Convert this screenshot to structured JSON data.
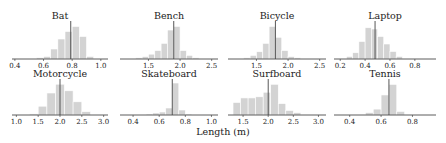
{
  "figure": {
    "xlabel": "Length (m)",
    "bar_color": "#d3d3d3",
    "bar_edge": "#ffffff",
    "mean_line_color": "#444444",
    "axis_color": "#333333"
  },
  "chart_data": [
    {
      "type": "bar",
      "title": "Bat",
      "xlim": [
        0.38,
        1.05
      ],
      "xticks": [
        0.4,
        0.6,
        0.8,
        1.0
      ],
      "tick_labels": [
        "0.4",
        "0.6",
        "0.8",
        "1.0"
      ],
      "bin_edges": [
        0.55,
        0.6,
        0.65,
        0.7,
        0.75,
        0.8,
        0.85,
        0.9,
        0.95,
        1.0
      ],
      "values": [
        1,
        2,
        8,
        16,
        22,
        26,
        18,
        2,
        0
      ],
      "mean": 0.79,
      "ylim": [
        0,
        28
      ]
    },
    {
      "type": "bar",
      "title": "Bench",
      "xlim": [
        1.05,
        2.6
      ],
      "xticks": [
        1.5,
        2.0,
        2.5
      ],
      "tick_labels": [
        "1.5",
        "2.0",
        "2.5"
      ],
      "bin_edges": [
        1.2,
        1.3,
        1.4,
        1.5,
        1.6,
        1.7,
        1.8,
        1.9,
        2.0,
        2.1,
        2.2,
        2.3,
        2.4
      ],
      "values": [
        0,
        1,
        2,
        4,
        7,
        13,
        24,
        27,
        7,
        3,
        1,
        0
      ],
      "mean": 1.9,
      "ylim": [
        0,
        29
      ]
    },
    {
      "type": "bar",
      "title": "Bicycle",
      "xlim": [
        1.05,
        2.6
      ],
      "xticks": [
        1.5,
        2.0,
        2.5
      ],
      "tick_labels": [
        "1.5",
        "2.0",
        "2.5"
      ],
      "bin_edges": [
        1.2,
        1.3,
        1.4,
        1.5,
        1.6,
        1.7,
        1.8,
        1.9,
        2.0,
        2.1,
        2.2,
        2.3,
        2.4,
        2.5
      ],
      "values": [
        0,
        1,
        3,
        6,
        13,
        27,
        18,
        7,
        2,
        1,
        0,
        0,
        0
      ],
      "mean": 1.8,
      "ylim": [
        0,
        29
      ]
    },
    {
      "type": "bar",
      "title": "Laptop",
      "xlim": [
        0.15,
        0.97
      ],
      "xticks": [
        0.2,
        0.4,
        0.6,
        0.8
      ],
      "tick_labels": [
        "0.2",
        "0.4",
        "0.6",
        "0.8"
      ],
      "bin_edges": [
        0.2,
        0.25,
        0.3,
        0.35,
        0.4,
        0.45,
        0.5,
        0.55,
        0.6,
        0.65,
        0.7,
        0.75,
        0.8,
        0.85
      ],
      "values": [
        0,
        2,
        5,
        14,
        25,
        24,
        18,
        12,
        6,
        2,
        0,
        0,
        0
      ],
      "mean": 0.48,
      "ylim": [
        0,
        28
      ]
    },
    {
      "type": "bar",
      "title": "Motorcycle",
      "xlim": [
        0.9,
        3.1
      ],
      "xticks": [
        1.0,
        1.5,
        2.0,
        2.5,
        3.0
      ],
      "tick_labels": [
        "1.0",
        "1.5",
        "2.0",
        "2.5",
        "3.0"
      ],
      "bin_edges": [
        1.3,
        1.5,
        1.7,
        1.9,
        2.1,
        2.3,
        2.5,
        2.7,
        2.9
      ],
      "values": [
        1,
        8,
        20,
        28,
        22,
        12,
        3,
        0
      ],
      "mean": 2.0,
      "ylim": [
        0,
        30
      ]
    },
    {
      "type": "bar",
      "title": "Skateboard",
      "xlim": [
        0.3,
        1.05
      ],
      "xticks": [
        0.4,
        0.6,
        0.8,
        1.0
      ],
      "tick_labels": [
        "0.4",
        "0.6",
        "0.8",
        "1.0"
      ],
      "bin_edges": [
        0.45,
        0.5,
        0.55,
        0.6,
        0.65,
        0.7,
        0.75,
        0.8,
        0.85
      ],
      "values": [
        0,
        1,
        2,
        3,
        7,
        32,
        5,
        1
      ],
      "mean": 0.7,
      "ylim": [
        0,
        33
      ]
    },
    {
      "type": "bar",
      "title": "Surfboard",
      "xlim": [
        1.2,
        3.15
      ],
      "xticks": [
        1.5,
        2.0,
        2.5,
        3.0
      ],
      "tick_labels": [
        "1.5",
        "2.0",
        "2.5",
        "3.0"
      ],
      "bin_edges": [
        1.3,
        1.45,
        1.6,
        1.75,
        1.9,
        2.05,
        2.2,
        2.35,
        2.5,
        2.65,
        2.8
      ],
      "values": [
        11,
        15,
        15,
        16,
        20,
        27,
        10,
        4,
        2,
        0
      ],
      "mean": 2.0,
      "ylim": [
        0,
        29
      ]
    },
    {
      "type": "bar",
      "title": "Tennis",
      "xlim": [
        0.3,
        0.95
      ],
      "xticks": [
        0.4,
        0.6,
        0.8
      ],
      "tick_labels": [
        "0.4",
        "0.6",
        "0.8"
      ],
      "bin_edges": [
        0.45,
        0.5,
        0.55,
        0.6,
        0.65,
        0.7,
        0.75,
        0.8,
        0.85
      ],
      "values": [
        0,
        2,
        5,
        17,
        26,
        3,
        0,
        0
      ],
      "mean": 0.65,
      "ylim": [
        0,
        28
      ]
    }
  ]
}
